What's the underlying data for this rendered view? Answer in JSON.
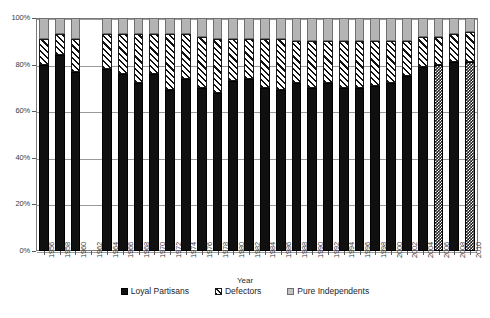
{
  "chart_data": {
    "type": "bar",
    "stacked": true,
    "normalized": true,
    "title": "",
    "xlabel": "Year",
    "ylabel": "",
    "ylim": [
      0,
      100
    ],
    "yticks": [
      0,
      20,
      40,
      60,
      80,
      100
    ],
    "ytick_labels": [
      "0%",
      "20%",
      "40%",
      "60%",
      "80%",
      "100%"
    ],
    "grid": true,
    "legend_position": "bottom",
    "categories": [
      "1956",
      "1958",
      "1960",
      "1962",
      "1964",
      "1966",
      "1968",
      "1970",
      "1972",
      "1974",
      "1976",
      "1978",
      "1980",
      "1982",
      "1984",
      "1986",
      "1988",
      "1990",
      "1992",
      "1994",
      "1996",
      "1998",
      "2000",
      "2002",
      "2004",
      "2006",
      "2008",
      "2010"
    ],
    "series": [
      {
        "name": "Loyal Partisans",
        "color": "#101010",
        "pattern": "solid",
        "values": [
          80,
          84,
          77,
          null,
          78,
          76,
          72,
          76,
          69,
          74,
          70,
          68,
          73,
          74,
          70,
          69,
          72,
          70,
          72,
          70,
          70,
          71,
          72,
          75,
          79,
          80,
          81,
          81
        ]
      },
      {
        "name": "Defectors",
        "color": "#ffffff",
        "pattern": "diagonal-hatch",
        "values": [
          11,
          9,
          14,
          null,
          15,
          17,
          21,
          17,
          24,
          19,
          22,
          23,
          18,
          17,
          21,
          22,
          18,
          20,
          18,
          20,
          20,
          19,
          18,
          15,
          13,
          12,
          12,
          13
        ]
      },
      {
        "name": "Pure Independents",
        "color": "#b4b4b4",
        "pattern": "solid-gray",
        "values": [
          9,
          7,
          9,
          null,
          7,
          7,
          7,
          7,
          7,
          7,
          8,
          9,
          9,
          9,
          9,
          9,
          10,
          10,
          10,
          10,
          10,
          10,
          10,
          10,
          8,
          8,
          7,
          6
        ]
      }
    ],
    "missing_categories": [
      "1962"
    ],
    "textured_bars": [
      "2006",
      "2010"
    ]
  },
  "legend": {
    "items": [
      {
        "label": "Loyal Partisans",
        "swatch": "loyal-swatch"
      },
      {
        "label": "Defectors",
        "swatch": "defectors-swatch"
      },
      {
        "label": "Pure Independents",
        "swatch": "pure-independents-swatch"
      }
    ]
  }
}
